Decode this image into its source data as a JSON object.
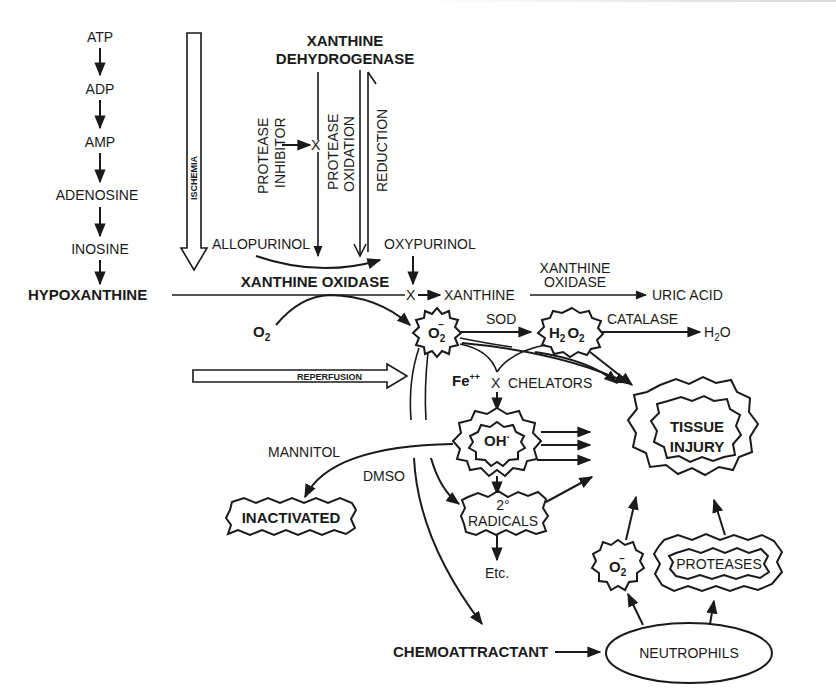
{
  "diagram": {
    "purine_cascade": [
      "ATP",
      "ADP",
      "AMP",
      "ADENOSINE",
      "INOSINE",
      "HYPOXANTHINE"
    ],
    "ischemia_label": "ISCHEMIA",
    "reperfusion_label": "REPERFUSION",
    "enzymes": {
      "xdh_line1": "XANTHINE",
      "xdh_line2": "DEHYDROGENASE",
      "xo": "XANTHINE OXIDASE",
      "xo2_line1": "XANTHINE",
      "xo2_line2": "OXIDASE",
      "sod": "SOD",
      "catalase": "CATALASE"
    },
    "conversion_labels": {
      "protease_inhibitor_line1": "PROTEASE",
      "protease_inhibitor_line2": "INHIBITOR",
      "protease_oxidation_line1": "PROTEASE",
      "protease_oxidation_line2": "OXIDATION",
      "reduction": "REDUCTION",
      "block_mark": "X"
    },
    "inhibitors": {
      "allopurinol": "ALLOPURINOL",
      "oxypurinol": "OXYPURINOL",
      "chelators": "CHELATORS",
      "mannitol": "MANNITOL",
      "dmso": "DMSO"
    },
    "metabolites": {
      "xanthine": "XANTHINE",
      "uric_acid": "URIC ACID",
      "o2": "O",
      "o2_sub": "2",
      "superoxide": "O",
      "superoxide_sub": "2",
      "superoxide_sup": "−",
      "h2o2_h": "H",
      "h2o2_sub1": "2",
      "h2o2_o": "O",
      "h2o2_sub2": "2",
      "h2o_h": "H",
      "h2o_sub": "2",
      "h2o_o": "O",
      "fe": "Fe",
      "fe_sup": "++",
      "hydroxyl": "OH",
      "hydroxyl_sup": "·",
      "secondary_line1": "2°",
      "secondary_line2": "RADICALS",
      "etc": "Etc.",
      "inactivated": "INACTIVATED"
    },
    "outcome": {
      "tissue_line1": "TISSUE",
      "tissue_line2": "INJURY"
    },
    "neutrophil_branch": {
      "chemoattractant": "CHEMOATTRACTANT",
      "neutrophils": "NEUTROPHILS",
      "superoxide": "O",
      "superoxide_sub": "2",
      "superoxide_sup": "−",
      "proteases": "PROTEASES"
    }
  }
}
